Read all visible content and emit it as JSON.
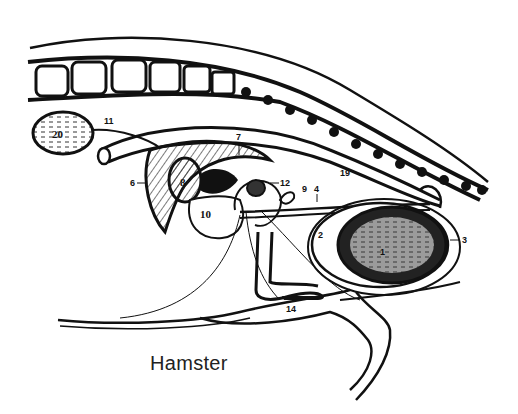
{
  "caption": "Hamster",
  "colors": {
    "ink": "#111111",
    "background": "#ffffff",
    "caption": "#222222"
  },
  "labels": {
    "l1": "1",
    "l2": "2",
    "l3": "3",
    "l4": "4",
    "l6": "6",
    "l7": "7",
    "l8": "8",
    "l9": "9",
    "l10": "10",
    "l11": "11",
    "l12": "12",
    "l14": "14",
    "l19": "19",
    "l20": "20"
  }
}
